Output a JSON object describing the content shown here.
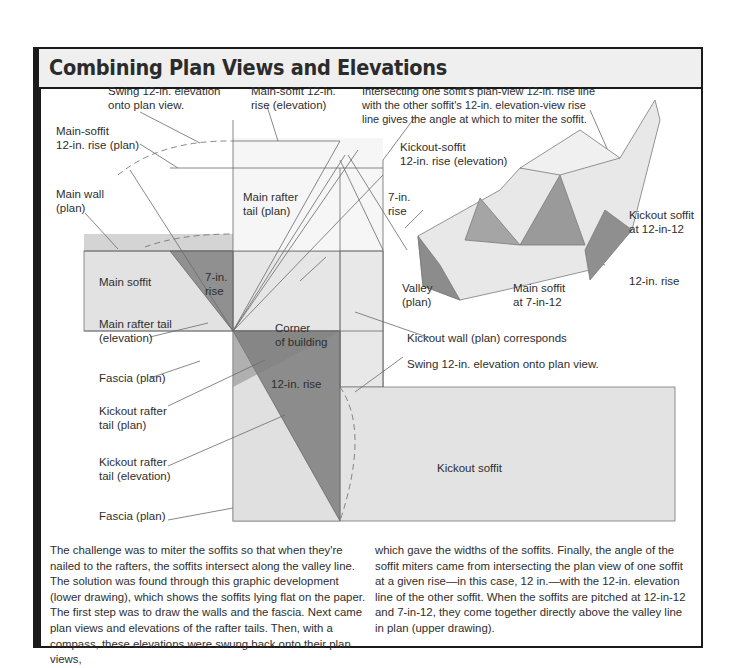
{
  "title": "Combining Plan Views and Elevations",
  "caption": "Intersecting one soffit's plan-view 12-in. rise line with the other soffit's 12-in. elevation-view rise line gives the angle at which to miter the soffit.",
  "caption_lines": [
    "Intersecting one soffit's plan-view 12-in. rise line",
    "with the other soffit's 12-in. elevation-view rise",
    "line gives the angle at which to miter the soffit."
  ],
  "labels": {
    "swing_top": [
      "Swing 12-in. elevation",
      "onto plan view."
    ],
    "main_soffit_elev": [
      "Main-soffit 12-in.",
      "rise (elevation)"
    ],
    "main_soffit_plan": [
      "Main-soffit",
      "12-in. rise (plan)"
    ],
    "kickout_soffit_elev": [
      "Kickout-soffit",
      "12-in. rise (elevation)"
    ],
    "main_wall": [
      "Main wall",
      "(plan)"
    ],
    "main_rafter_plan": [
      "Main rafter",
      "tail (plan)"
    ],
    "seven_rise_right": [
      "7-in.",
      "rise"
    ],
    "main_soffit": "Main soffit",
    "seven_rise_left": [
      "7-in.",
      "rise"
    ],
    "valley": [
      "Valley",
      "(plan)"
    ],
    "main_soffit_pitch": [
      "Main soffit",
      "at 7-in-12"
    ],
    "kickout_soffit_pitch": [
      "Kickout soffit",
      "at 12-in-12"
    ],
    "twelve_rise_right": "12-in. rise",
    "main_rafter_elev": [
      "Main rafter tail",
      "(elevation)"
    ],
    "corner": [
      "Corner",
      "of building"
    ],
    "kickout_wall": "Kickout wall (plan) corresponds",
    "fascia_1": "Fascia (plan)",
    "twelve_rise": "12-in. rise",
    "swing_bottom": "Swing 12-in. elevation onto plan view.",
    "kickout_rafter_plan": [
      "Kickout rafter",
      "tail (plan)"
    ],
    "kickout_rafter_elev": [
      "Kickout rafter",
      "tail (elevation)"
    ],
    "kickout_soffit": "Kickout soffit",
    "fascia_2": "Fascia (plan)"
  },
  "body": {
    "col1": "The challenge was to miter the soffits so that when they're nailed to the rafters, the soffits intersect along the valley line. The solution was found through this graphic development (lower drawing), which shows the soffits lying flat on the paper. The first step was to draw the walls and the fascia. Next came plan views and elevations of the rafter tails. Then, with a compass, these elevations were swung back onto their plan views,",
    "col2": "which gave the widths of the soffits. Finally, the angle of the soffit miters came from intersecting the plan view of one soffit at a given rise—in this case, 12 in.—with the 12-in. elevation line of the other soffit. When the soffits are pitched at 12-in-12 and 7-in-12, they come together directly above the valley line in plan (upper drawing)."
  },
  "colors": {
    "frame": "#1a1a1a",
    "title_bg": "#efefef",
    "soffit_fill": "#e4e4e4",
    "wall_fill": "#d2d2d2",
    "triangle_fill": "#8e8e8e",
    "line": "#5a5a5a"
  }
}
